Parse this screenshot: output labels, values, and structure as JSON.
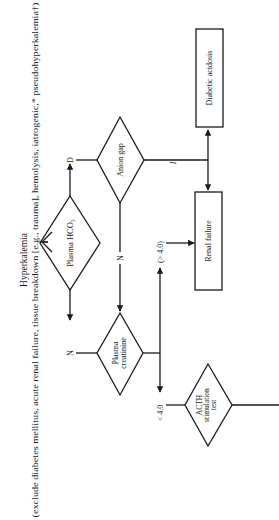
{
  "diagram": {
    "orientation": "rotated 90 degrees counter-clockwise",
    "title": "Hyperkalemia",
    "subtitle": "(exclude diabetes mellitus, acute renal failure, tissue breakdown [e.g., trauma], hemolysis, iatrogenic,* pseudohyperkalemia†)",
    "nodes": {
      "hco3": {
        "label": "Plasma HCO₃",
        "shape": "diamond"
      },
      "anion_gap": {
        "label": "Anion gap",
        "shape": "diamond"
      },
      "creatinine": {
        "line1": "Plasma",
        "line2": "creatinine",
        "shape": "diamond"
      },
      "acth": {
        "line1": "ACTH",
        "line2": "stimulation",
        "line3": "test",
        "shape": "diamond"
      },
      "diabetic_acidosis": {
        "label": "Diabetic acidosis",
        "shape": "box"
      },
      "renal_failure": {
        "label": "Renal failure",
        "shape": "box"
      }
    },
    "edge_labels": {
      "hco3_decreased": "D",
      "hco3_normal": "N",
      "anion_gap_increased": "I",
      "anion_gap_normal": "N",
      "creatinine_high": "(> 4.0)",
      "creatinine_low": "< 4.0"
    },
    "colors": {
      "ink": "#1a1a1a",
      "background": "#ffffff"
    }
  }
}
